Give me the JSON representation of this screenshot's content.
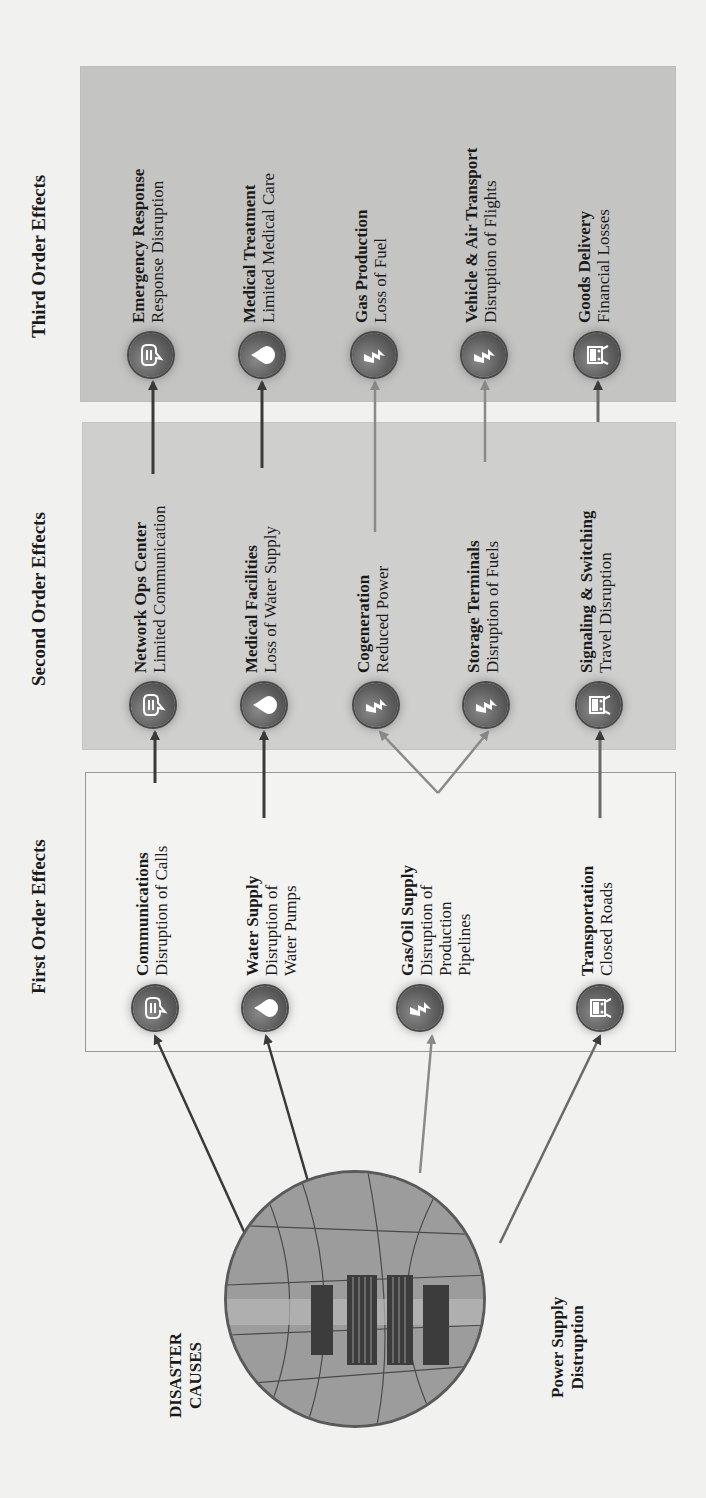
{
  "columns": {
    "first": {
      "title": "First Order Effects"
    },
    "second": {
      "title": "Second Order Effects"
    },
    "third": {
      "title": "Third Order Effects"
    }
  },
  "cause": {
    "title_line1": "DISASTER",
    "title_line2": "CAUSES",
    "subtitle_line1": "Power Supply",
    "subtitle_line2": "Distruption",
    "image": "power-substation-photo"
  },
  "first_order": [
    {
      "icon": "speech-bubble-icon",
      "title": "Communications",
      "lines": [
        "Disruption of Calls"
      ]
    },
    {
      "icon": "water-drop-icon",
      "title": "Water Supply",
      "lines": [
        "Disruption of",
        "Water Pumps"
      ]
    },
    {
      "icon": "lightning-bolt-icon",
      "title": "Gas/Oil Supply",
      "lines": [
        "Disruption of",
        "Production",
        "Pipelines"
      ]
    },
    {
      "icon": "train-icon",
      "title": "Transportation",
      "lines": [
        "Closed Roads"
      ]
    }
  ],
  "second_order": [
    {
      "icon": "speech-bubble-icon",
      "title": "Network Ops Center",
      "lines": [
        "Limited Communication"
      ]
    },
    {
      "icon": "water-drop-icon",
      "title": "Medical Facilities",
      "lines": [
        "Loss of Water Supply"
      ]
    },
    {
      "icon": "lightning-bolt-icon",
      "title": "Cogeneration",
      "lines": [
        "Reduced Power"
      ]
    },
    {
      "icon": "lightning-bolt-icon",
      "title": "Storage Terminals",
      "lines": [
        "Disruption of Fuels"
      ]
    },
    {
      "icon": "train-icon",
      "title": "Signaling & Switching",
      "lines": [
        "Travel Disruption"
      ]
    }
  ],
  "third_order": [
    {
      "icon": "speech-bubble-icon",
      "title": "Emergency Response",
      "lines": [
        "Response Disruption"
      ]
    },
    {
      "icon": "water-drop-icon",
      "title": "Medical Treatment",
      "lines": [
        "Limited Medical Care"
      ]
    },
    {
      "icon": "lightning-bolt-icon",
      "title": "Gas Production",
      "lines": [
        "Loss of Fuel"
      ]
    },
    {
      "icon": "lightning-bolt-icon",
      "title": "Vehicle & Air Transport",
      "lines": [
        "Disruption of Flights"
      ]
    },
    {
      "icon": "train-icon",
      "title": "Goods Delivery",
      "lines": [
        "Financial Losses"
      ]
    }
  ],
  "colors": {
    "first_box_bg": "#f3f3f2",
    "second_box_bg": "#cfcfce",
    "third_box_bg": "#c4c4c3",
    "icon_fill": "#5e5e5e",
    "arrow_dark": "#3a3a3a",
    "arrow_light": "#8a8a8a"
  }
}
